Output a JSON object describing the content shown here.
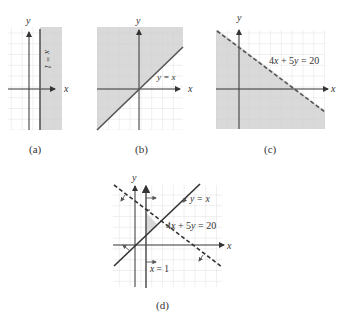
{
  "figure": {
    "panels": [
      {
        "id": "a",
        "caption": "(a)",
        "axis_x_label": "x",
        "axis_y_label": "y",
        "boundary_label": "x = 1",
        "boundary": "x = 1",
        "boundary_style": "solid",
        "shaded_region": "x >= 1"
      },
      {
        "id": "b",
        "caption": "(b)",
        "axis_x_label": "x",
        "axis_y_label": "y",
        "boundary_label": "y = x",
        "boundary": "y = x",
        "boundary_style": "solid",
        "shaded_region": "y >= x"
      },
      {
        "id": "c",
        "caption": "(c)",
        "axis_x_label": "x",
        "axis_y_label": "y",
        "boundary_label": "4x + 5y = 20",
        "boundary": "4x + 5y = 20",
        "boundary_style": "dashed",
        "shaded_region": "4x + 5y < 20"
      },
      {
        "id": "d",
        "caption": "(d)",
        "axis_x_label": "x",
        "axis_y_label": "y",
        "labels": [
          "y = x",
          "4x + 5y = 20",
          "x = 1"
        ],
        "shaded_region": "x >= 1, y >= x, 4x + 5y < 20"
      }
    ],
    "colors": {
      "shade": "#d9d9d9",
      "grid": "#cfcfcf",
      "line": "#555555",
      "axis": "#333333"
    }
  }
}
